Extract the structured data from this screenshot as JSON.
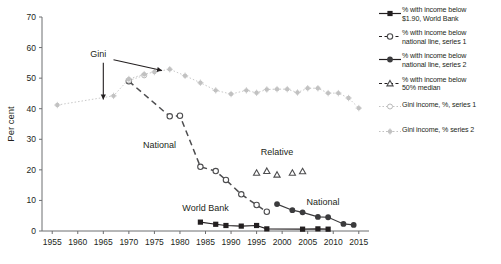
{
  "chart_data": {
    "type": "line",
    "title": "",
    "xlabel": "",
    "ylabel": "Per cent",
    "xlim": [
      1953,
      2017
    ],
    "ylim": [
      0,
      70
    ],
    "xticks": [
      "1955",
      "1960",
      "1965",
      "1970",
      "1975",
      "1980",
      "1985",
      "1990",
      "1995",
      "2000",
      "2005",
      "2010",
      "2015"
    ],
    "yticks": [
      "0",
      "10",
      "20",
      "30",
      "40",
      "50",
      "60",
      "70"
    ],
    "grid": false,
    "legend_position": "right",
    "series": [
      {
        "name": "% with income below $1.90, World Bank",
        "marker": "filled-square",
        "color": "#231f20",
        "points": [
          [
            1984,
            2.9
          ],
          [
            1987,
            2.2
          ],
          [
            1989,
            1.8
          ],
          [
            1992,
            1.6
          ],
          [
            1995,
            1.8
          ],
          [
            1997,
            0.7
          ],
          [
            2004,
            0.6
          ],
          [
            2007,
            0.7
          ],
          [
            2009,
            0.6
          ]
        ]
      },
      {
        "name": "% with income below national line, series 1",
        "marker": "open-circle",
        "color": "#4d4d4f",
        "points": [
          [
            1970,
            49.0
          ],
          [
            1978,
            37.5
          ],
          [
            1980,
            37.7
          ],
          [
            1984,
            21.0
          ],
          [
            1987,
            19.6
          ],
          [
            1989,
            16.7
          ],
          [
            1992,
            12.0
          ],
          [
            1995,
            8.5
          ],
          [
            1997,
            6.3
          ]
        ]
      },
      {
        "name": "% with income below national line, series 2",
        "marker": "filled-circle",
        "color": "#3b3b3d",
        "points": [
          [
            1999,
            8.8
          ],
          [
            2002,
            6.8
          ],
          [
            2004,
            6.1
          ],
          [
            2007,
            4.6
          ],
          [
            2009,
            4.5
          ],
          [
            2012,
            2.3
          ],
          [
            2014,
            2.0
          ]
        ]
      },
      {
        "name": "% with income below 50% median",
        "marker": "open-triangle",
        "color": "#4d4d4f",
        "points": [
          [
            1995,
            19.0
          ],
          [
            1997,
            19.6
          ],
          [
            1999,
            18.4
          ],
          [
            2002,
            19.0
          ],
          [
            2004,
            19.5
          ]
        ]
      },
      {
        "name": "Gini income, %, series 1",
        "marker": "open-circle-light",
        "color": "#c9c9c9",
        "points": [
          [
            1970,
            49.2
          ],
          [
            1973,
            50.9
          ]
        ]
      },
      {
        "name": "Gini income, % series 2",
        "marker": "dot-light",
        "color": "#c9c9c9",
        "points": [
          [
            1956,
            41.2
          ],
          [
            1967,
            44.2
          ],
          [
            1970,
            49.7
          ],
          [
            1973,
            51.3
          ],
          [
            1975,
            52.0
          ],
          [
            1978,
            52.9
          ],
          [
            1981,
            50.8
          ],
          [
            1984,
            48.5
          ],
          [
            1987,
            46.0
          ],
          [
            1990,
            44.8
          ],
          [
            1993,
            46.0
          ],
          [
            1995,
            45.2
          ],
          [
            1997,
            46.3
          ],
          [
            1999,
            46.4
          ],
          [
            2001,
            46.4
          ],
          [
            2003,
            45.3
          ],
          [
            2005,
            46.7
          ],
          [
            2007,
            46.7
          ],
          [
            2009,
            45.1
          ],
          [
            2011,
            45.1
          ],
          [
            2013,
            43.5
          ],
          [
            2015,
            40.2
          ]
        ]
      }
    ],
    "annotations": [
      {
        "text": "Gini",
        "x": 1964,
        "y": 57
      },
      {
        "text": "National",
        "x": 1976,
        "y": 27
      },
      {
        "text": "World Bank",
        "x": 1985,
        "y": 6.5
      },
      {
        "text": "Relative",
        "x": 1999,
        "y": 25
      },
      {
        "text": "National",
        "x": 2008,
        "y": 8.5
      }
    ]
  },
  "legend": {
    "items": [
      {
        "key": "filled-square",
        "label": "% with income below\n$1.90, World Bank",
        "line1": "% with income below",
        "line2": "$1.90, World Bank"
      },
      {
        "key": "open-circle",
        "label": "% with income below national line, series 1",
        "line1": "% with income below",
        "line2": "national line, series 1"
      },
      {
        "key": "filled-circle",
        "label": "% with income below national line, series 2",
        "line1": "% with income below",
        "line2": "national line, series 2"
      },
      {
        "key": "open-triangle",
        "label": "% with income below 50% median",
        "line1": "% with income below",
        "line2": "50% median"
      },
      {
        "key": "open-circle-light",
        "label": "Gini income, %, series 1",
        "line1": "Gini income, %, series 1",
        "line2": ""
      },
      {
        "key": "dot-light",
        "label": "Gini income, % series 2",
        "line1": "Gini income, % series 2",
        "line2": ""
      }
    ]
  },
  "colors": {
    "dark": "#231f20",
    "mid": "#4d4d4f",
    "light": "#c9c9c9",
    "background": "#ffffff"
  }
}
